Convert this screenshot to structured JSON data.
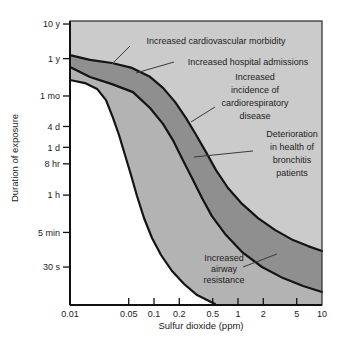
{
  "figure": {
    "background": "#ffffff",
    "plot_bg": "#cbcbcb",
    "mid_band_color": "#b3b3b3",
    "dark_band_color": "#8f8f8f",
    "white_region_color": "#ffffff",
    "curve_color": "#141414",
    "leader_color": "#3a3a3a",
    "text_color": "#1c1c1c"
  },
  "chart_data": {
    "type": "area",
    "title": "",
    "xlabel": "Sulfur dioxide (ppm)",
    "ylabel": "Duration of exposure",
    "x_scale": "log",
    "y_scale": "log",
    "xlim": [
      0.01,
      10
    ],
    "ylim_seconds": [
      2.4,
      386000000
    ],
    "grid": false,
    "x_ticks": [
      {
        "label": "0.01",
        "value": 0.01,
        "tick": false
      },
      {
        "label": "0.05",
        "value": 0.05,
        "tick": true
      },
      {
        "label": "0.1",
        "value": 0.1,
        "tick": true
      },
      {
        "label": "0.2",
        "value": 0.2,
        "tick": true
      },
      {
        "label": "0.5",
        "value": 0.5,
        "tick": true
      },
      {
        "label": "1",
        "value": 1,
        "tick": true
      },
      {
        "label": "2",
        "value": 2,
        "tick": true
      },
      {
        "label": "5",
        "value": 5,
        "tick": true
      },
      {
        "label": "10",
        "value": 10,
        "tick": false
      }
    ],
    "y_ticks": [
      {
        "label": "10 y",
        "seconds": 315600000
      },
      {
        "label": "1 y",
        "seconds": 31560000
      },
      {
        "label": "1 mo",
        "seconds": 2630000
      },
      {
        "label": "4 d",
        "seconds": 345600
      },
      {
        "label": "1 d",
        "seconds": 86400
      },
      {
        "label": "8 hr",
        "seconds": 28800
      },
      {
        "label": "1 h",
        "seconds": 3600
      },
      {
        "label": "5 min",
        "seconds": 300
      },
      {
        "label": "30 s",
        "seconds": 30
      }
    ],
    "regions": [
      {
        "name": "no-observed-effect",
        "color_key": "white_region_color"
      },
      {
        "name": "mid-effect-band",
        "color_key": "mid_band_color"
      },
      {
        "name": "dark-effect-band",
        "color_key": "dark_band_color"
      },
      {
        "name": "upper-background",
        "color_key": "plot_bg"
      }
    ],
    "curves": [
      {
        "name": "lower-threshold-boundary",
        "points": [
          [
            0.01,
            7600000
          ],
          [
            0.0151,
            6200000
          ],
          [
            0.021,
            4200000
          ],
          [
            0.0268,
            2000000
          ],
          [
            0.0325,
            610000
          ],
          [
            0.0383,
            196000
          ],
          [
            0.0452,
            52000
          ],
          [
            0.0533,
            13700
          ],
          [
            0.0627,
            3380
          ],
          [
            0.076,
            782
          ],
          [
            0.0947,
            207
          ],
          [
            0.121,
            67
          ],
          [
            0.164,
            23
          ],
          [
            0.228,
            9.7
          ],
          [
            0.326,
            4.65
          ],
          [
            0.428,
            3.34
          ],
          [
            0.532,
            2.56
          ]
        ]
      },
      {
        "name": "middle-boundary",
        "points": [
          [
            0.01,
            18100000
          ],
          [
            0.0173,
            9300000
          ],
          [
            0.0316,
            5800000
          ],
          [
            0.0562,
            3400000
          ],
          [
            0.0897,
            1180000
          ],
          [
            0.128,
            410000
          ],
          [
            0.168,
            140000
          ],
          [
            0.215,
            42000
          ],
          [
            0.283,
            11200
          ],
          [
            0.373,
            2960
          ],
          [
            0.489,
            892
          ],
          [
            0.719,
            252
          ],
          [
            1.12,
            81
          ],
          [
            1.93,
            30
          ],
          [
            3.44,
            14.4
          ],
          [
            5.96,
            8.5
          ],
          [
            10,
            5.7
          ]
        ]
      },
      {
        "name": "upper-boundary",
        "points": [
          [
            0.01,
            40000000
          ],
          [
            0.0173,
            29000000
          ],
          [
            0.0316,
            23600000
          ],
          [
            0.0547,
            17000000
          ],
          [
            0.0897,
            9400000
          ],
          [
            0.128,
            4500000
          ],
          [
            0.178,
            1770000
          ],
          [
            0.24,
            610000
          ],
          [
            0.316,
            200000
          ],
          [
            0.416,
            63000
          ],
          [
            0.547,
            19000
          ],
          [
            0.76,
            5750
          ],
          [
            1.12,
            2000
          ],
          [
            1.73,
            780
          ],
          [
            2.75,
            355
          ],
          [
            4.52,
            180
          ],
          [
            6.81,
            121
          ],
          [
            10,
            87
          ]
        ]
      }
    ],
    "annotations": [
      {
        "name": "cardiovascular-morbidity",
        "lines": [
          "Increased cardiovascular morbidity"
        ],
        "cx_frac": 0.5794,
        "baseline_frac": 0.081,
        "dy": 11,
        "leader": [
          [
            0.2381,
            0.088
          ],
          [
            0.1667,
            0.1514
          ]
        ]
      },
      {
        "name": "hospital-admissions",
        "lines": [
          "Increased hospital admissions"
        ],
        "cx_frac": 0.7063,
        "baseline_frac": 0.1549,
        "dy": 11,
        "leader": [
          [
            0.4127,
            0.1444
          ],
          [
            0.2619,
            0.1831
          ]
        ]
      },
      {
        "name": "cardiorespiratory-disease",
        "lines": [
          "Increased",
          "incidence of",
          "cardiorespiratory",
          "disease"
        ],
        "cx_frac": 0.7341,
        "baseline_frac": 0.2077,
        "dy": 13,
        "leader": [
          [
            0.5754,
            0.3028
          ],
          [
            0.4802,
            0.3556
          ]
        ]
      },
      {
        "name": "bronchitis-patients",
        "lines": [
          "Deterioration",
          "in health of",
          "bronchitis",
          "patients"
        ],
        "cx_frac": 0.881,
        "baseline_frac": 0.4085,
        "dy": 13,
        "leader": [
          [
            0.7262,
            0.4577
          ],
          [
            0.4921,
            0.4789
          ]
        ]
      },
      {
        "name": "airway-resistance",
        "lines": [
          "Increased",
          "airway",
          "resistance"
        ],
        "cx_frac": 0.6111,
        "baseline_frac": 0.8451,
        "dy": 11,
        "leader": [
          [
            0.6865,
            0.8662
          ],
          [
            0.8214,
            0.8204
          ]
        ]
      }
    ]
  }
}
